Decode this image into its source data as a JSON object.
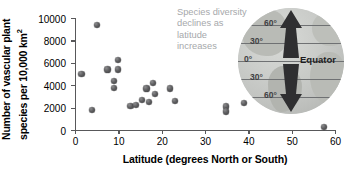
{
  "chart_data": {
    "type": "scatter",
    "title": "",
    "xlabel": "Latitude (degrees North or South)",
    "ylabel": "Number of vascular plant species per 10,000 km",
    "ylabel_exponent": "2",
    "xlim": [
      0,
      60
    ],
    "ylim": [
      0,
      10000
    ],
    "xticks": [
      0,
      10,
      20,
      30,
      40,
      50,
      60
    ],
    "yticks": [
      0,
      2000,
      4000,
      6000,
      8000,
      10000
    ],
    "grid": false,
    "legend": false,
    "point_color": "#5e5e60",
    "axis_color": "#58585a",
    "points": [
      {
        "x": 1.5,
        "y": 5000
      },
      {
        "x": 4.0,
        "y": 1800
      },
      {
        "x": 5.0,
        "y": 9400
      },
      {
        "x": 7.5,
        "y": 5400
      },
      {
        "x": 9.0,
        "y": 4350
      },
      {
        "x": 9.0,
        "y": 3750
      },
      {
        "x": 10.0,
        "y": 6250
      },
      {
        "x": 10.0,
        "y": 5400
      },
      {
        "x": 12.8,
        "y": 2150
      },
      {
        "x": 14.0,
        "y": 2250
      },
      {
        "x": 15.5,
        "y": 2650
      },
      {
        "x": 16.5,
        "y": 3700
      },
      {
        "x": 17.0,
        "y": 2500
      },
      {
        "x": 18.0,
        "y": 4200
      },
      {
        "x": 18.5,
        "y": 3200
      },
      {
        "x": 22.0,
        "y": 3700
      },
      {
        "x": 23.0,
        "y": 2600
      },
      {
        "x": 34.8,
        "y": 2100
      },
      {
        "x": 34.8,
        "y": 1650
      },
      {
        "x": 39.0,
        "y": 2400
      },
      {
        "x": 57.5,
        "y": 250
      }
    ]
  },
  "annotation": {
    "text": "Species diversity declines as latitude increases",
    "color": "#a6a8ab"
  },
  "globe": {
    "equator_label": "Equator",
    "lat_labels": [
      "60°",
      "30°",
      "0°",
      "30°",
      "60°"
    ],
    "arrow_color": "#2f2f31"
  }
}
